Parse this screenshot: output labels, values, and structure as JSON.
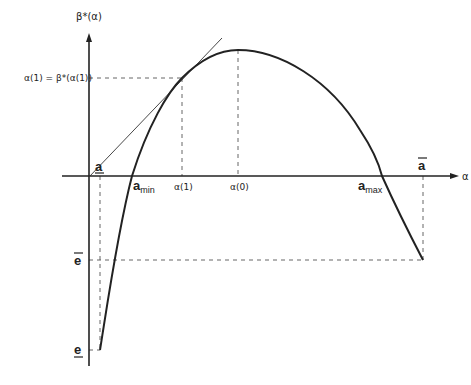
{
  "diagram": {
    "y_axis_label": "β*(α)",
    "x_axis_label": "α",
    "y_annotation": "α(1) = β*(α(1))",
    "x_ticks": {
      "a_under": "a",
      "a_min_base": "a",
      "a_min_sub": "min",
      "alpha1": "α(1)",
      "alpha0": "α(0)",
      "a_max_base": "a",
      "a_max_sub": "max",
      "a_bar": "a"
    },
    "y_ticks": {
      "e_bar": "e",
      "e_under": "e"
    },
    "colors": {
      "curve": "#222222",
      "axis": "#222222",
      "dash": "#555555"
    }
  }
}
